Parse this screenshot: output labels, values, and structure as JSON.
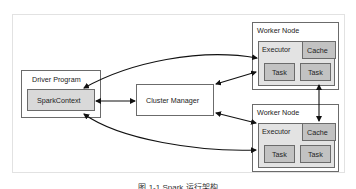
{
  "diagram": {
    "driver_program": {
      "title": "Driver Program",
      "spark_context": "SparkContext"
    },
    "cluster_manager": "Cluster Manager",
    "worker_nodes": [
      {
        "title": "Worker Node",
        "executor": "Executor",
        "cache": "Cache",
        "tasks": [
          "Task",
          "Task"
        ]
      },
      {
        "title": "Worker Node",
        "executor": "Executor",
        "cache": "Cache",
        "tasks": [
          "Task",
          "Task"
        ]
      }
    ],
    "colors": {
      "border": "#6b6b6b",
      "spark_context_fill": "#d9d9d9",
      "task_fill": "#c2c2c2",
      "executor_fill": "#e3e3e3"
    }
  },
  "caption": "图 1-1 Spark 运行架构"
}
